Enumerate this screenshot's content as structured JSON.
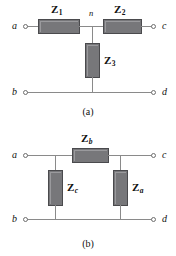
{
  "figure": {
    "title_absent": true,
    "panels": [
      {
        "id": "a",
        "caption": "(a)",
        "topology": "T-network",
        "node_label": "n",
        "terminals": [
          {
            "name": "a",
            "label": "a",
            "position": "top-left"
          },
          {
            "name": "c",
            "label": "c",
            "position": "top-right"
          },
          {
            "name": "b",
            "label": "b",
            "position": "bottom-left"
          },
          {
            "name": "d",
            "label": "d",
            "position": "bottom-right"
          }
        ],
        "impedances": [
          {
            "name": "Z1",
            "base": "Z",
            "sub": "1",
            "sub_style": "number",
            "orientation": "horizontal",
            "branch": "series-left"
          },
          {
            "name": "Z2",
            "base": "Z",
            "sub": "2",
            "sub_style": "number",
            "orientation": "horizontal",
            "branch": "series-right"
          },
          {
            "name": "Z3",
            "base": "Z",
            "sub": "3",
            "sub_style": "number",
            "orientation": "vertical",
            "branch": "shunt-middle"
          }
        ]
      },
      {
        "id": "b",
        "caption": "(b)",
        "topology": "Pi-network",
        "terminals": [
          {
            "name": "a",
            "label": "a",
            "position": "top-left"
          },
          {
            "name": "c",
            "label": "c",
            "position": "top-right"
          },
          {
            "name": "b",
            "label": "b",
            "position": "bottom-left"
          },
          {
            "name": "d",
            "label": "d",
            "position": "bottom-right"
          }
        ],
        "impedances": [
          {
            "name": "Zb",
            "base": "Z",
            "sub": "b",
            "sub_style": "italic",
            "orientation": "horizontal",
            "branch": "series-top"
          },
          {
            "name": "Zc",
            "base": "Z",
            "sub": "c",
            "sub_style": "italic",
            "orientation": "vertical",
            "branch": "shunt-left"
          },
          {
            "name": "Za",
            "base": "Z",
            "sub": "a",
            "sub_style": "italic",
            "orientation": "vertical",
            "branch": "shunt-right"
          }
        ]
      }
    ]
  },
  "colors": {
    "background": "#ffffff",
    "wire": "#8a8a8a",
    "box_fill": "#77777a",
    "box_stroke": "#4a4a4d",
    "text": "#111111",
    "terminal_stroke": "#6e6e6e"
  }
}
